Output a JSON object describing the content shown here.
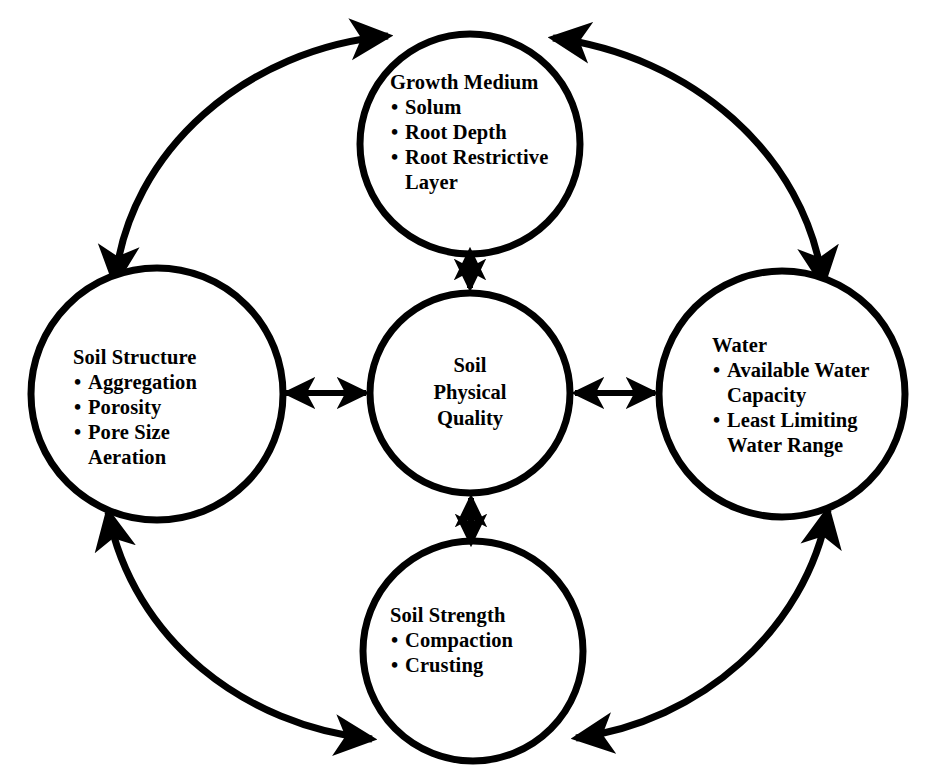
{
  "diagram": {
    "stroke_color": "#000000",
    "background_color": "#ffffff",
    "center": {
      "name": "Soil Physical Quality",
      "lines": [
        "Soil",
        "Physical",
        "Quality"
      ]
    },
    "nodes": [
      {
        "id": "growth-medium",
        "title": "Growth Medium",
        "bullets": [
          "Solum",
          "Root Depth",
          "Root Restrictive\nLayer"
        ]
      },
      {
        "id": "soil-structure",
        "title": "Soil Structure",
        "bullets": [
          "Aggregation",
          "Porosity",
          "Pore Size\nAeration"
        ]
      },
      {
        "id": "water",
        "title": "Water",
        "bullets": [
          "Available Water\nCapacity",
          "Least Limiting\nWater Range"
        ]
      },
      {
        "id": "soil-strength",
        "title": "Soil Strength",
        "bullets": [
          "Compaction",
          "Crusting"
        ]
      }
    ],
    "connectors": [
      {
        "id": "center-growth-medium",
        "from": "Soil Physical Quality",
        "to": "Growth Medium",
        "style": "double-arrow"
      },
      {
        "id": "center-soil-structure",
        "from": "Soil Physical Quality",
        "to": "Soil Structure",
        "style": "double-arrow"
      },
      {
        "id": "center-water",
        "from": "Soil Physical Quality",
        "to": "Water",
        "style": "double-arrow"
      },
      {
        "id": "center-soil-strength",
        "from": "Soil Physical Quality",
        "to": "Soil Strength",
        "style": "double-arrow"
      },
      {
        "id": "arc-structure-growth",
        "from": "Soil Structure",
        "to": "Growth Medium",
        "style": "double-arrow-arc"
      },
      {
        "id": "arc-growth-water",
        "from": "Growth Medium",
        "to": "Water",
        "style": "double-arrow-arc"
      },
      {
        "id": "arc-water-strength",
        "from": "Water",
        "to": "Soil Strength",
        "style": "double-arrow-arc"
      },
      {
        "id": "arc-strength-structure",
        "from": "Soil Strength",
        "to": "Soil Structure",
        "style": "double-arrow-arc"
      }
    ]
  }
}
